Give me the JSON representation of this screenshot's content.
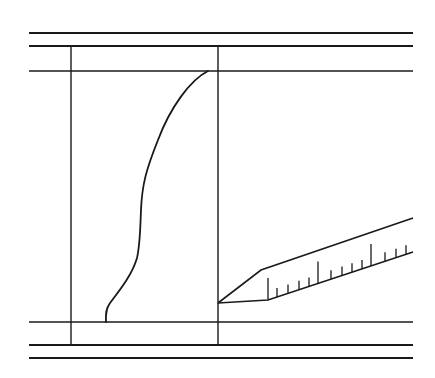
{
  "diagram": {
    "stroke_color": "#1a1a1a",
    "background": "#ffffff",
    "horizontal_lines": [
      {
        "y": 33,
        "x1": 29,
        "x2": 413,
        "weight": 2.2
      },
      {
        "y": 46,
        "x1": 29,
        "x2": 413,
        "weight": 2.2
      },
      {
        "y": 71,
        "x1": 29,
        "x2": 413,
        "weight": 1.4
      },
      {
        "y": 322,
        "x1": 29,
        "x2": 413,
        "weight": 1.4
      },
      {
        "y": 345,
        "x1": 29,
        "x2": 413,
        "weight": 2.2
      },
      {
        "y": 358,
        "x1": 29,
        "x2": 413,
        "weight": 2.2
      }
    ],
    "vertical_lines": [
      {
        "x": 71,
        "y1": 46,
        "y2": 345
      },
      {
        "x": 218,
        "y1": 46,
        "y2": 345
      }
    ],
    "profile_curve": {
      "start": [
        208,
        71
      ],
      "end": [
        106,
        322
      ]
    },
    "probe": {
      "tip": [
        218,
        303
      ],
      "upper_edge": [
        [
          218,
          303
        ],
        [
          261,
          270
        ],
        [
          413,
          218
        ]
      ],
      "lower_edge": [
        [
          218,
          303
        ],
        [
          268,
          300
        ],
        [
          413,
          252
        ]
      ],
      "ticks": [
        {
          "x": 268,
          "type": "major"
        },
        {
          "x": 277,
          "type": "minor"
        },
        {
          "x": 288,
          "type": "minor"
        },
        {
          "x": 299,
          "type": "minor"
        },
        {
          "x": 309,
          "type": "minor"
        },
        {
          "x": 318,
          "type": "major"
        },
        {
          "x": 331,
          "type": "minor"
        },
        {
          "x": 342,
          "type": "minor"
        },
        {
          "x": 352,
          "type": "minor"
        },
        {
          "x": 362,
          "type": "minor"
        },
        {
          "x": 371,
          "type": "major"
        },
        {
          "x": 385,
          "type": "minor"
        },
        {
          "x": 396,
          "type": "minor"
        },
        {
          "x": 406,
          "type": "minor"
        }
      ]
    }
  }
}
